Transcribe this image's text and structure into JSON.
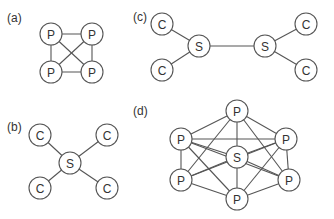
{
  "panels": [
    {
      "id": "a",
      "label": "(a)",
      "label_pos": [
        7,
        22
      ],
      "nodes": [
        {
          "id": "p1",
          "text": "P",
          "x": 51,
          "y": 34
        },
        {
          "id": "p2",
          "text": "P",
          "x": 92,
          "y": 34
        },
        {
          "id": "p3",
          "text": "P",
          "x": 51,
          "y": 72
        },
        {
          "id": "p4",
          "text": "P",
          "x": 92,
          "y": 72
        }
      ],
      "edges": [
        [
          "p1",
          "p2"
        ],
        [
          "p1",
          "p3"
        ],
        [
          "p1",
          "p4"
        ],
        [
          "p2",
          "p3"
        ],
        [
          "p2",
          "p4"
        ],
        [
          "p3",
          "p4"
        ]
      ]
    },
    {
      "id": "c",
      "label": "(c)",
      "label_pos": [
        133,
        21
      ],
      "nodes": [
        {
          "id": "c1",
          "text": "C",
          "x": 162,
          "y": 24
        },
        {
          "id": "c2",
          "text": "C",
          "x": 162,
          "y": 70
        },
        {
          "id": "s1",
          "text": "S",
          "x": 199,
          "y": 46
        },
        {
          "id": "s2",
          "text": "S",
          "x": 265,
          "y": 46
        },
        {
          "id": "c3",
          "text": "C",
          "x": 306,
          "y": 24
        },
        {
          "id": "c4",
          "text": "C",
          "x": 306,
          "y": 70
        }
      ],
      "edges": [
        [
          "c1",
          "s1"
        ],
        [
          "c2",
          "s1"
        ],
        [
          "s1",
          "s2"
        ],
        [
          "s2",
          "c3"
        ],
        [
          "s2",
          "c4"
        ]
      ]
    },
    {
      "id": "b",
      "label": "(b)",
      "label_pos": [
        7,
        131
      ],
      "nodes": [
        {
          "id": "c1",
          "text": "C",
          "x": 40,
          "y": 135
        },
        {
          "id": "c2",
          "text": "C",
          "x": 107,
          "y": 135
        },
        {
          "id": "s",
          "text": "S",
          "x": 70,
          "y": 163
        },
        {
          "id": "c3",
          "text": "C",
          "x": 40,
          "y": 188
        },
        {
          "id": "c4",
          "text": "C",
          "x": 107,
          "y": 188
        }
      ],
      "edges": [
        [
          "c1",
          "s"
        ],
        [
          "c2",
          "s"
        ],
        [
          "c3",
          "s"
        ],
        [
          "c4",
          "s"
        ]
      ]
    },
    {
      "id": "d",
      "label": "(d)",
      "label_pos": [
        133,
        115
      ],
      "nodes": [
        {
          "id": "pt",
          "text": "P",
          "x": 237,
          "y": 111
        },
        {
          "id": "pl",
          "text": "P",
          "x": 181,
          "y": 139
        },
        {
          "id": "pr",
          "text": "P",
          "x": 286,
          "y": 139
        },
        {
          "id": "s",
          "text": "S",
          "x": 237,
          "y": 157
        },
        {
          "id": "pll",
          "text": "P",
          "x": 181,
          "y": 180
        },
        {
          "id": "plr",
          "text": "P",
          "x": 289,
          "y": 180
        },
        {
          "id": "pb",
          "text": "P",
          "x": 237,
          "y": 199
        }
      ],
      "edges": [
        [
          "pt",
          "pl"
        ],
        [
          "pt",
          "pr"
        ],
        [
          "pt",
          "s"
        ],
        [
          "pt",
          "pll"
        ],
        [
          "pt",
          "plr"
        ],
        [
          "pl",
          "pr"
        ],
        [
          "pl",
          "s"
        ],
        [
          "pl",
          "pll"
        ],
        [
          "pl",
          "pb"
        ],
        [
          "pl",
          "plr"
        ],
        [
          "pr",
          "s"
        ],
        [
          "pr",
          "plr"
        ],
        [
          "pr",
          "pb"
        ],
        [
          "pr",
          "pll"
        ],
        [
          "s",
          "pll"
        ],
        [
          "s",
          "plr"
        ],
        [
          "s",
          "pb"
        ],
        [
          "pll",
          "pb"
        ],
        [
          "plr",
          "pb"
        ]
      ]
    }
  ],
  "node_radius": 11,
  "colors": {
    "stroke": "#555555",
    "text": "#333333",
    "fill": "#ffffff"
  }
}
